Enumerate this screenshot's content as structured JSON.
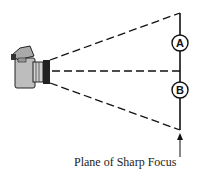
{
  "diagram": {
    "camera": {
      "icon": "camera-icon"
    },
    "points": [
      {
        "id": "A",
        "label": "A"
      },
      {
        "id": "B",
        "label": "B"
      }
    ],
    "caption": "Plane of Sharp Focus",
    "colors": {
      "line": "#111111",
      "camera_body": "#b8b8b8",
      "lens": "#2a2a2a",
      "background": "#ffffff"
    }
  }
}
